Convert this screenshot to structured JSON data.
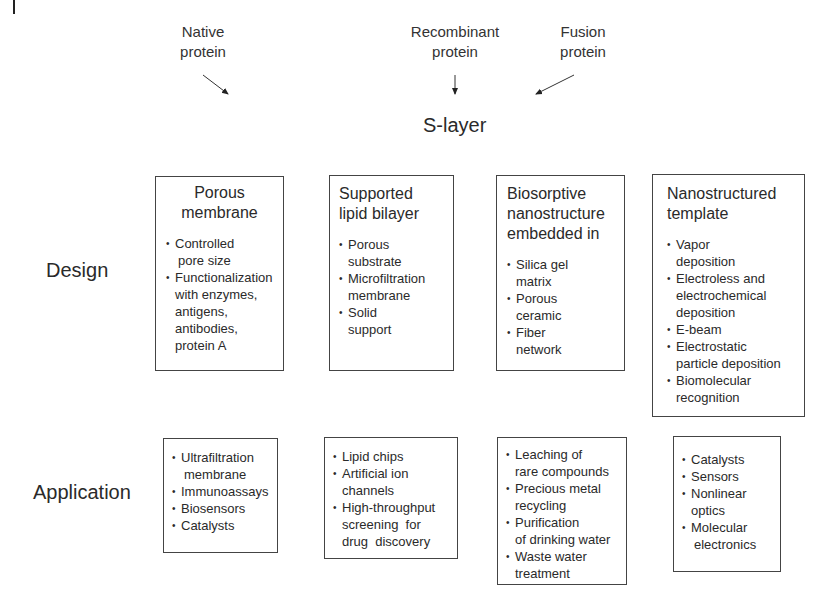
{
  "sources": [
    {
      "line1": "Native",
      "line2": "protein"
    },
    {
      "line1": "Recombinant",
      "line2": "protein"
    },
    {
      "line1": "Fusion",
      "line2": "protein"
    }
  ],
  "center_label": "S-layer",
  "row_labels": {
    "design": "Design",
    "application": "Application"
  },
  "design_boxes": [
    {
      "title": [
        "Porous",
        "membrane"
      ],
      "items": [
        [
          "Controlled",
          "pore size"
        ],
        [
          "Functionalization",
          "with enzymes,",
          "antigens,",
          "antibodies,",
          "protein A"
        ]
      ]
    },
    {
      "title": [
        "Supported",
        "lipid bilayer"
      ],
      "items": [
        [
          "Porous",
          "substrate"
        ],
        [
          "Microfiltration",
          "membrane"
        ],
        [
          "Solid",
          "support"
        ]
      ]
    },
    {
      "title": [
        "Biosorptive",
        "nanostructure",
        "embedded in"
      ],
      "items": [
        [
          "Silica gel",
          "matrix"
        ],
        [
          "Porous",
          "ceramic"
        ],
        [
          "Fiber",
          "network"
        ]
      ]
    },
    {
      "title": [
        "Nanostructured",
        "template"
      ],
      "items": [
        [
          "Vapor",
          "deposition"
        ],
        [
          "Electroless and",
          "electrochemical",
          "deposition"
        ],
        [
          "E-beam"
        ],
        [
          "Electrostatic",
          "particle deposition"
        ],
        [
          "Biomolecular",
          "recognition"
        ]
      ]
    }
  ],
  "application_boxes": [
    {
      "items": [
        [
          "Ultrafiltration",
          "membrane"
        ],
        [
          "Immunoassays"
        ],
        [
          "Biosensors"
        ],
        [
          "Catalysts"
        ]
      ]
    },
    {
      "items": [
        [
          "Lipid chips"
        ],
        [
          "Artificial ion",
          "channels"
        ],
        [
          "High-throughput",
          "screening  for",
          "drug  discovery"
        ]
      ]
    },
    {
      "items": [
        [
          "Leaching of",
          "rare compounds"
        ],
        [
          "Precious metal",
          "recycling"
        ],
        [
          "Purification",
          "of drinking water"
        ],
        [
          "Waste water",
          "treatment"
        ]
      ]
    },
    {
      "items": [
        [
          "Catalysts"
        ],
        [
          "Sensors"
        ],
        [
          "Nonlinear",
          "optics"
        ],
        [
          "Molecular",
          "electronics"
        ]
      ]
    }
  ]
}
